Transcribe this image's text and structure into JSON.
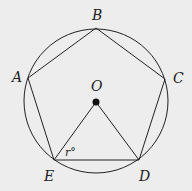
{
  "diagram": {
    "colors": {
      "stroke": "#222222",
      "background": "#ededed"
    },
    "circle": {
      "cx": 96,
      "cy": 101,
      "r": 72
    },
    "center": {
      "label": "O",
      "x": 96,
      "y": 102
    },
    "vertices": [
      {
        "label": "A",
        "x": 28,
        "y": 78
      },
      {
        "label": "B",
        "x": 96,
        "y": 28
      },
      {
        "label": "C",
        "x": 165,
        "y": 79
      },
      {
        "label": "D",
        "x": 139,
        "y": 160
      },
      {
        "label": "E",
        "x": 54,
        "y": 160
      }
    ],
    "angle_label": "r°",
    "segments": [
      "OE",
      "OD",
      "ED"
    ]
  }
}
